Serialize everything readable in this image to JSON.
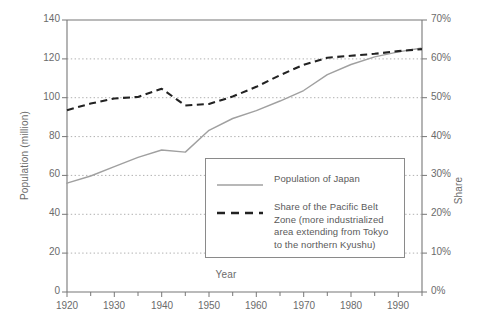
{
  "chart_data": {
    "type": "line",
    "title": "",
    "xlabel": "Year",
    "ylabel": "Population (million)",
    "ylabel_secondary": "Share",
    "grid": true,
    "legend_position": "inside-bottom-right",
    "xlim": [
      1920,
      1995
    ],
    "ylim": [
      0,
      140
    ],
    "ylim_secondary": [
      0,
      70
    ],
    "x_ticks": [
      1920,
      1930,
      1940,
      1950,
      1960,
      1970,
      1980,
      1990
    ],
    "x_minor_tick_step": 5,
    "y_ticks": [
      0,
      20,
      40,
      60,
      80,
      100,
      120,
      140
    ],
    "y_ticks_secondary": [
      "0%",
      "10%",
      "20%",
      "30%",
      "40%",
      "50%",
      "60%",
      "70%"
    ],
    "series": [
      {
        "name": "Population of Japan",
        "style": "solid",
        "color": "#a0a0a0",
        "axis": "left",
        "x": [
          1920,
          1925,
          1930,
          1935,
          1940,
          1945,
          1950,
          1955,
          1960,
          1965,
          1970,
          1975,
          1980,
          1985,
          1990,
          1995
        ],
        "values": [
          56,
          59.7,
          64.5,
          69.3,
          73.1,
          72,
          83.2,
          89.3,
          93.4,
          98.3,
          103.7,
          111.9,
          117.1,
          121.0,
          123.6,
          125.6
        ]
      },
      {
        "name": "Share of the Pacific Belt Zone (more industrialized area extending from Tokyo to the northern Kyushu)",
        "style": "dashed",
        "color": "#222222",
        "axis": "right",
        "x": [
          1920,
          1925,
          1930,
          1935,
          1940,
          1945,
          1950,
          1955,
          1960,
          1965,
          1970,
          1975,
          1980,
          1985,
          1990,
          1995
        ],
        "values": [
          46.8,
          48.5,
          49.8,
          50.2,
          52.3,
          48.0,
          48.4,
          50.3,
          52.8,
          55.8,
          58.5,
          60.3,
          60.8,
          61.3,
          62.0,
          62.5
        ]
      }
    ]
  },
  "axes": {
    "left_title": "Population (million)",
    "right_title": "Share",
    "x_title": "Year",
    "left_tick_labels": [
      "140",
      "120",
      "100",
      "80",
      "60",
      "40",
      "20",
      "0"
    ],
    "right_tick_labels": [
      "70%",
      "60%",
      "50%",
      "40%",
      "30%",
      "20%",
      "10%",
      "0%"
    ],
    "x_tick_labels": [
      "1920",
      "1930",
      "1940",
      "1950",
      "1960",
      "1970",
      "1980",
      "1990"
    ]
  },
  "legend": {
    "entries": [
      {
        "key": "solid-line-key",
        "label": "Population of Japan"
      },
      {
        "key": "dashed-line-key",
        "label": "Share of the Pacific Belt\nZone (more industrialized\narea extending from Tokyo\nto the northern Kyushu)"
      }
    ]
  },
  "colors": {
    "solid_series": "#a0a0a0",
    "dashed_series": "#222222",
    "axis": "#6f6f6f",
    "grid": "#b8b8b8",
    "text": "#6b6b6b"
  }
}
